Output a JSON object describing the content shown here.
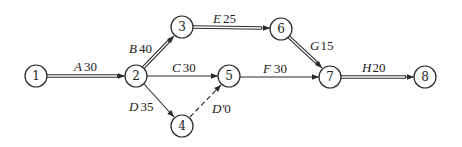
{
  "diagram": {
    "type": "activity-on-arrow network",
    "nodes": [
      {
        "id": "1",
        "label": "1",
        "x": 36,
        "y": 76
      },
      {
        "id": "2",
        "label": "2",
        "x": 136,
        "y": 76
      },
      {
        "id": "3",
        "label": "3",
        "x": 182,
        "y": 27
      },
      {
        "id": "4",
        "label": "4",
        "x": 182,
        "y": 126
      },
      {
        "id": "5",
        "label": "5",
        "x": 229,
        "y": 76
      },
      {
        "id": "6",
        "label": "6",
        "x": 281,
        "y": 29
      },
      {
        "id": "7",
        "label": "7",
        "x": 330,
        "y": 77
      },
      {
        "id": "8",
        "label": "8",
        "x": 425,
        "y": 77
      }
    ],
    "edges": [
      {
        "from": "1",
        "to": "2",
        "activity": "A",
        "duration": "30",
        "style": "double"
      },
      {
        "from": "2",
        "to": "3",
        "activity": "B",
        "duration": "40",
        "style": "double"
      },
      {
        "from": "2",
        "to": "5",
        "activity": "C",
        "duration": "30",
        "style": "single"
      },
      {
        "from": "2",
        "to": "4",
        "activity": "D",
        "duration": "35",
        "style": "single"
      },
      {
        "from": "4",
        "to": "5",
        "activity": "D'",
        "duration": "0",
        "style": "dashed"
      },
      {
        "from": "3",
        "to": "6",
        "activity": "E",
        "duration": "25",
        "style": "double"
      },
      {
        "from": "5",
        "to": "7",
        "activity": "F",
        "duration": "30",
        "style": "single"
      },
      {
        "from": "6",
        "to": "7",
        "activity": "G",
        "duration": "15",
        "style": "double"
      },
      {
        "from": "7",
        "to": "8",
        "activity": "H",
        "duration": "20",
        "style": "double"
      }
    ],
    "labels": {
      "A": {
        "name": "A",
        "dur": "30"
      },
      "B": {
        "name": "B",
        "dur": "40"
      },
      "C": {
        "name": "C",
        "dur": "30"
      },
      "D": {
        "name": "D",
        "dur": "35"
      },
      "Dp": {
        "name": "D'",
        "dur": "0"
      },
      "E": {
        "name": "E",
        "dur": "25"
      },
      "F": {
        "name": "F",
        "dur": "30"
      },
      "G": {
        "name": "G",
        "dur": "15"
      },
      "H": {
        "name": "H",
        "dur": "20"
      }
    },
    "colors": {
      "line": "#2a2a2a",
      "background": "#ffffff"
    }
  }
}
